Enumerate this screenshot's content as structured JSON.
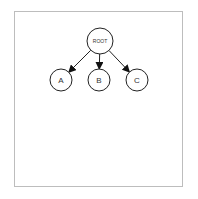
{
  "diagram": {
    "type": "tree",
    "root": {
      "id": "root",
      "label": "ROOT",
      "cx": 100,
      "cy": 41,
      "r": 13
    },
    "children": [
      {
        "id": "a",
        "label": "A",
        "cx": 61,
        "cy": 80,
        "r": 11
      },
      {
        "id": "b",
        "label": "B",
        "cx": 99,
        "cy": 80,
        "r": 11
      },
      {
        "id": "c",
        "label": "C",
        "cx": 137,
        "cy": 80,
        "r": 11
      }
    ],
    "edges": [
      {
        "from": "root",
        "to": "a"
      },
      {
        "from": "root",
        "to": "b"
      },
      {
        "from": "root",
        "to": "c"
      }
    ],
    "colors": {
      "stroke": "#222222",
      "fill": "#ffffff",
      "frame": "#bdbdbd"
    }
  }
}
